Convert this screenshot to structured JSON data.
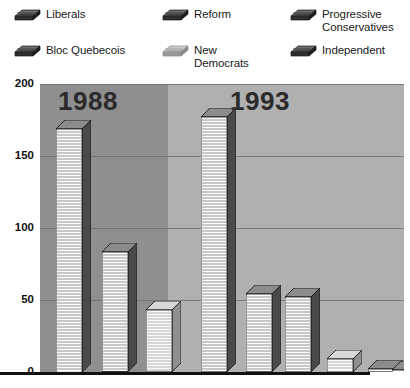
{
  "legend": {
    "items": [
      {
        "label": "Liberals",
        "icon": "bar-swatch-icon",
        "shade": "dark",
        "col": 0,
        "row": 0
      },
      {
        "label": "Reform",
        "icon": "bar-swatch-icon",
        "shade": "dark",
        "col": 1,
        "row": 0
      },
      {
        "label": "Progressive\nConservatives",
        "icon": "bar-swatch-icon",
        "shade": "dark",
        "col": 2,
        "row": 0
      },
      {
        "label": "Bloc Quebecois",
        "icon": "bar-swatch-icon",
        "shade": "dark",
        "col": 0,
        "row": 1
      },
      {
        "label": "New\nDemocrats",
        "icon": "bar-swatch-icon",
        "shade": "light",
        "col": 1,
        "row": 1
      },
      {
        "label": "Independent",
        "icon": "bar-swatch-icon",
        "shade": "dark",
        "col": 2,
        "row": 1
      }
    ]
  },
  "chart_data": {
    "type": "bar",
    "title": "",
    "xlabel": "",
    "ylabel": "",
    "ylim": [
      0,
      200
    ],
    "yticks": [
      0,
      50,
      100,
      150,
      200
    ],
    "ytick_labels": [
      "0",
      "50",
      "100",
      "150",
      "200"
    ],
    "grid": true,
    "legend_position": "top",
    "groups": [
      "1988",
      "1993"
    ],
    "group_labels": [
      "1988",
      "1993"
    ],
    "series": [
      {
        "name": "Liberals",
        "values": [
          83,
          177
        ]
      },
      {
        "name": "Progressive Conservatives",
        "values": [
          169,
          2
        ]
      },
      {
        "name": "New Democrats",
        "values": [
          43,
          9
        ]
      },
      {
        "name": "Bloc Quebecois",
        "values": [
          0,
          54
        ]
      },
      {
        "name": "Reform",
        "values": [
          0,
          52
        ]
      },
      {
        "name": "Independent",
        "values": [
          0,
          1
        ]
      }
    ],
    "bars": [
      {
        "group": "1988",
        "series": "Progressive Conservatives",
        "value": 169,
        "shade": "dark"
      },
      {
        "group": "1988",
        "series": "Liberals",
        "value": 83,
        "shade": "dark"
      },
      {
        "group": "1988",
        "series": "New Democrats",
        "value": 43,
        "shade": "light"
      },
      {
        "group": "1993",
        "series": "Liberals",
        "value": 177,
        "shade": "dark"
      },
      {
        "group": "1993",
        "series": "Bloc Quebecois",
        "value": 54,
        "shade": "dark"
      },
      {
        "group": "1993",
        "series": "Reform",
        "value": 52,
        "shade": "dark"
      },
      {
        "group": "1993",
        "series": "New Democrats",
        "value": 9,
        "shade": "light"
      },
      {
        "group": "1993",
        "series": "Progressive Conservatives",
        "value": 2,
        "shade": "dark"
      },
      {
        "group": "1993",
        "series": "Independent",
        "value": 1,
        "shade": "dark"
      }
    ]
  },
  "colors": {
    "panel_1988_bg": "#8f8f8f",
    "panel_1993_bg": "#b0b0b0",
    "gridline": "#6f6f6f",
    "axis": "#111111",
    "text": "#1a1a1a",
    "year_text": "#2b2b2b",
    "bar_dark_top": "#7a7a7a",
    "bar_light_top": "#cfcfcf",
    "bar_face": "#f2f2f2",
    "bar_stripe": "#8a8a8a"
  }
}
